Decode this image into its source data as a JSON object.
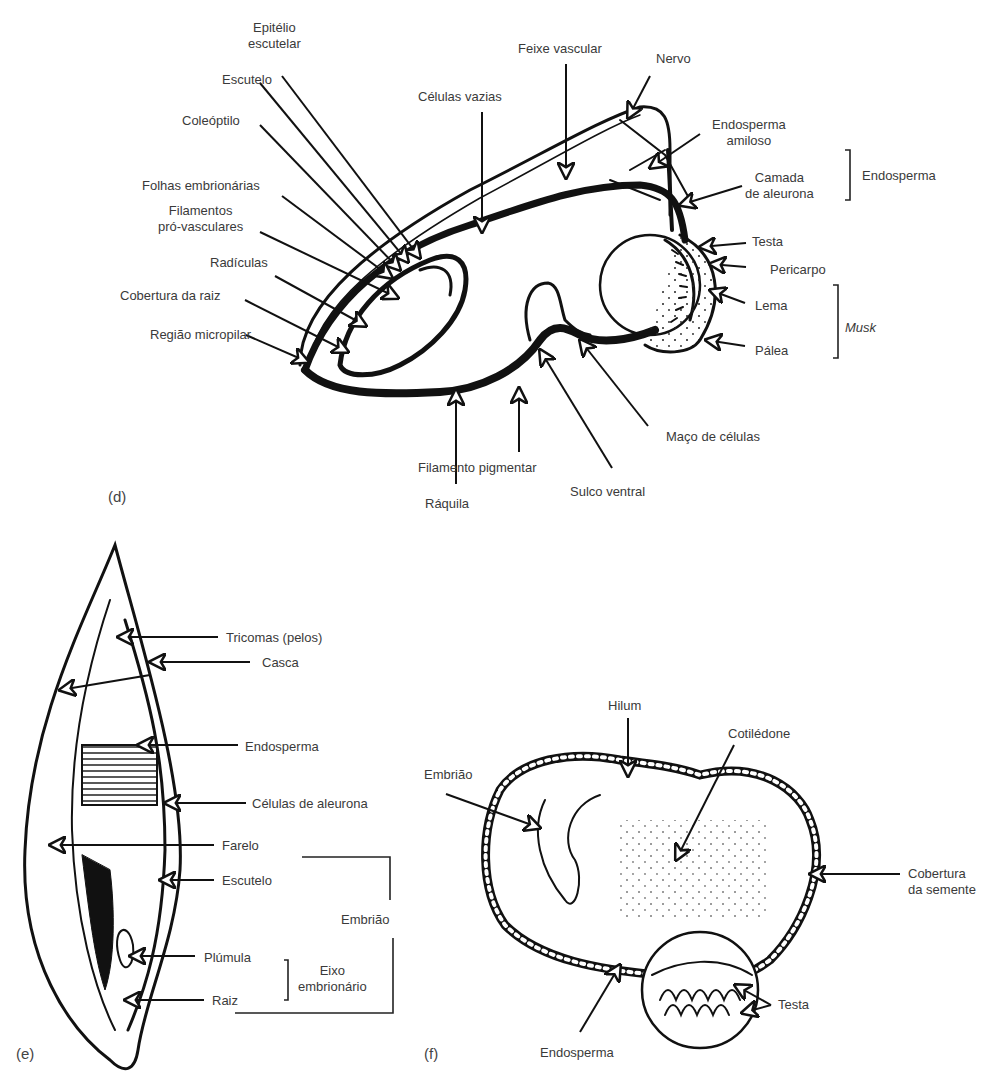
{
  "panel_d": {
    "letter": "(d)",
    "labels": {
      "epitelio": "Epitélio\nescutelar",
      "escutelo": "Escutelo",
      "coleoptilo": "Coleóptilo",
      "celulas_vazias": "Células vazias",
      "feixe_vascular": "Feixe vascular",
      "nervo": "Nervo",
      "endosperma_amiloso": "Endosperma\namiloso",
      "camada_aleurona": "Camada\nde aleurona",
      "endosperma_group": "Endosperma",
      "folhas": "Folhas embrionárias",
      "filamentos": "Filamentos\npró-vasculares",
      "radiculas": "Radículas",
      "cobertura_raiz": "Cobertura da raiz",
      "regiao_micropilar": "Região micropilar",
      "testa": "Testa",
      "pericarpo": "Pericarpo",
      "lema": "Lema",
      "palea": "Pálea",
      "musk_group": "Musk",
      "maco_celulas": "Maço de células",
      "filamento_pigmentar": "Filamento pigmentar",
      "sulco_ventral": "Sulco ventral",
      "raquila": "Ráquila"
    }
  },
  "panel_e": {
    "letter": "(e)",
    "labels": {
      "tricomas": "Tricomas (pelos)",
      "casca": "Casca",
      "endosperma": "Endosperma",
      "celulas_aleurona": "Células de aleurona",
      "farelo": "Farelo",
      "escutelo": "Escutelo",
      "embriao_group": "Embrião",
      "plumula": "Plúmula",
      "raiz": "Raiz",
      "eixo_group": "Eixo\nembrionário"
    }
  },
  "panel_f": {
    "letter": "(f)",
    "labels": {
      "hilum": "Hilum",
      "cotiledone": "Cotilédone",
      "embriao": "Embrião",
      "cobertura_semente": "Cobertura\nda semente",
      "testa": "Testa",
      "endosperma": "Endosperma"
    }
  }
}
